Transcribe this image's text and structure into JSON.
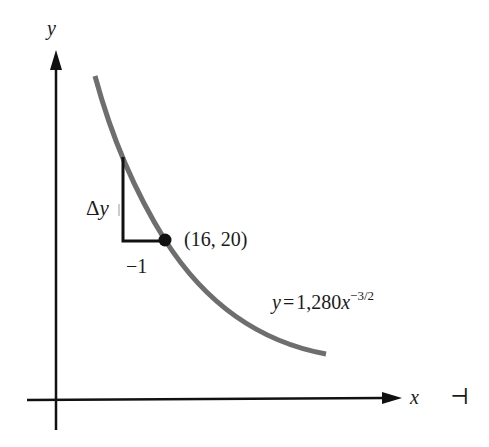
{
  "figure": {
    "axes": {
      "x_label": "x",
      "y_label": "y"
    },
    "curve": {
      "equation_lhs": "y",
      "equation_eq": "=",
      "equation_coef": "1,280",
      "equation_var": "x",
      "equation_exp": "−3/2",
      "color": "#6e6e6e"
    },
    "point": {
      "label": "(16, 20)",
      "x": 16,
      "y": 20
    },
    "slope_triangle": {
      "vertical_label_delta": "Δ",
      "vertical_label_var": "y",
      "horizontal_label": "−1"
    },
    "margin_mark": "⊣"
  }
}
